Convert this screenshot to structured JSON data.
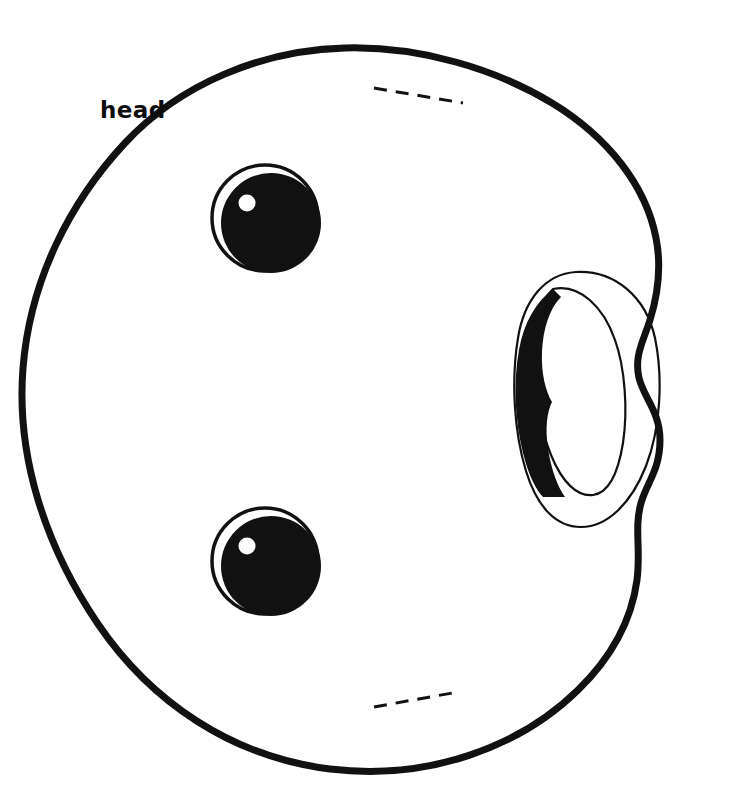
{
  "document": {
    "kind": "sewing-pattern-template",
    "title": "head",
    "background_color": "#ffffff",
    "ink_color": "#111111"
  },
  "labels": {
    "head": "head"
  },
  "canvas": {
    "width": 740,
    "height": 807
  },
  "shapes": {
    "head_outline": {
      "name": "head",
      "stroke_color": "#111111",
      "stroke_width": 7,
      "fill": "none",
      "bounds": {
        "x": 22,
        "y": 45,
        "width": 643,
        "height": 728
      }
    },
    "eye_upper": {
      "name": "upper-eye",
      "outer_circle": {
        "cx": 265,
        "cy": 218,
        "r": 53,
        "stroke_width": 3,
        "fill": "none"
      },
      "pupil": {
        "cx": 271,
        "cy": 223,
        "r": 50,
        "fill": "#111111"
      },
      "highlight": {
        "cx": 247,
        "cy": 203,
        "r": 8,
        "fill": "#ffffff"
      }
    },
    "eye_lower": {
      "name": "lower-eye",
      "outer_circle": {
        "cx": 265,
        "cy": 561,
        "r": 53,
        "stroke_width": 3,
        "fill": "none"
      },
      "pupil": {
        "cx": 271,
        "cy": 566,
        "r": 50,
        "fill": "#111111"
      },
      "highlight": {
        "cx": 247,
        "cy": 546,
        "r": 8,
        "fill": "#ffffff"
      }
    },
    "ear": {
      "name": "ear",
      "outer_outline_stroke": 2,
      "inner_outline_stroke": 2,
      "shaded_crescent_fill": "#111111",
      "bounds": {
        "x": 517,
        "y": 270,
        "width": 145,
        "height": 258
      }
    },
    "dash_line_top": {
      "name": "top-dashed-guide",
      "x1": 374,
      "y1": 88,
      "x2": 463,
      "y2": 103,
      "stroke_width": 3,
      "dash_pattern": "13 9"
    },
    "dash_line_bottom": {
      "name": "bottom-dashed-guide",
      "x1": 374,
      "y1": 707,
      "x2": 458,
      "y2": 692,
      "stroke_width": 3,
      "dash_pattern": "13 9"
    }
  }
}
